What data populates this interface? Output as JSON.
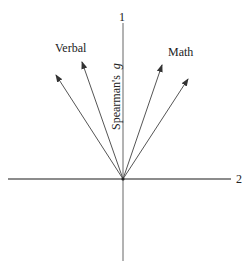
{
  "diagram": {
    "type": "factor-vector-diagram",
    "origin": {
      "x": 123,
      "y": 179
    },
    "axes": {
      "vertical": {
        "label_top": "1",
        "name": "Spearman's",
        "name_italic": "g",
        "x": 123,
        "y1": 23,
        "y2": 261
      },
      "horizontal": {
        "label_right": "2",
        "y": 179,
        "x1": 8,
        "x2": 231
      }
    },
    "groups": [
      {
        "label": "Verbal",
        "x": 55,
        "y": 52
      },
      {
        "label": "Math",
        "x": 168,
        "y": 56
      }
    ],
    "vectors": [
      {
        "name": "verbal-vector-1",
        "group": "Verbal",
        "tip": {
          "x": 56,
          "y": 75
        }
      },
      {
        "name": "verbal-vector-2",
        "group": "Verbal",
        "tip": {
          "x": 82,
          "y": 62
        }
      },
      {
        "name": "math-vector-1",
        "group": "Math",
        "tip": {
          "x": 162,
          "y": 65
        }
      },
      {
        "name": "math-vector-2",
        "group": "Math",
        "tip": {
          "x": 188,
          "y": 79
        }
      }
    ],
    "colors": {
      "line": "#555555",
      "text": "#222222",
      "background": "#ffffff"
    }
  }
}
